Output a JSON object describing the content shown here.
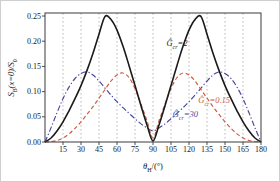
{
  "figure": {
    "bg": "#ffffff",
    "frame_color": "#3a3a3a",
    "grid_color": "#ababab"
  },
  "axes": {
    "xlabel": {
      "base": "θ",
      "sub": "H",
      "rest": "/(°)"
    },
    "ylabel": {
      "base": "S",
      "sub": "B",
      "mid": "(x=0)/S",
      "sub2": "0"
    },
    "x_ticks": [
      "15",
      "30",
      "45",
      "60",
      "75",
      "90",
      "105",
      "120",
      "135",
      "150",
      "165",
      "180"
    ],
    "y_ticks": [
      "0.00",
      "0.05",
      "0.10",
      "0.15",
      "0.20",
      "0.25"
    ]
  },
  "chart_data": {
    "type": "line",
    "title": "",
    "xlabel": "theta_H in degrees",
    "ylabel": "S_B(x=0)/S_0",
    "xlim": [
      0,
      180
    ],
    "ylim": [
      0,
      0.256
    ],
    "grid": "vertical dashed gridlines every 15 degrees, no horizontal gridlines",
    "legend_position": "inline curve annotations",
    "x": [
      0,
      5,
      10,
      15,
      20,
      25,
      30,
      35,
      40,
      45,
      50,
      55,
      60,
      65,
      70,
      75,
      80,
      85,
      90,
      95,
      100,
      105,
      110,
      115,
      120,
      125,
      130,
      135,
      140,
      145,
      150,
      155,
      160,
      165,
      170,
      175,
      180
    ],
    "series": [
      {
        "name": "Ĝcr=2",
        "color": "#1a1a1a",
        "style": "solid",
        "values": [
          0,
          0.008,
          0.022,
          0.04,
          0.062,
          0.086,
          0.112,
          0.142,
          0.176,
          0.214,
          0.249,
          0.243,
          0.222,
          0.19,
          0.152,
          0.112,
          0.072,
          0.034,
          0.002,
          0.034,
          0.072,
          0.112,
          0.152,
          0.19,
          0.222,
          0.243,
          0.249,
          0.214,
          0.176,
          0.142,
          0.112,
          0.086,
          0.062,
          0.04,
          0.022,
          0.008,
          0
        ]
      },
      {
        "name": "Ĝcr=0.15",
        "color": "#cf5a3d",
        "style": "dashed",
        "values": [
          0,
          0.001,
          0.003,
          0.008,
          0.016,
          0.027,
          0.04,
          0.055,
          0.07,
          0.087,
          0.104,
          0.121,
          0.133,
          0.137,
          0.128,
          0.106,
          0.075,
          0.042,
          0.008,
          0.042,
          0.075,
          0.106,
          0.128,
          0.137,
          0.133,
          0.121,
          0.104,
          0.087,
          0.07,
          0.055,
          0.04,
          0.027,
          0.016,
          0.008,
          0.003,
          0.001,
          0
        ]
      },
      {
        "name": "Ĝcr=30",
        "color": "#45459d",
        "style": "dashdot",
        "values": [
          0,
          0.028,
          0.058,
          0.086,
          0.109,
          0.126,
          0.136,
          0.139,
          0.133,
          0.121,
          0.107,
          0.093,
          0.08,
          0.068,
          0.057,
          0.046,
          0.036,
          0.028,
          0.022,
          0.028,
          0.036,
          0.046,
          0.057,
          0.068,
          0.08,
          0.093,
          0.107,
          0.121,
          0.133,
          0.139,
          0.136,
          0.126,
          0.109,
          0.086,
          0.058,
          0.028,
          0
        ]
      }
    ],
    "annotations": [
      {
        "base": "Ĝ",
        "sub": "cr",
        "rest": "=2",
        "theta": 110,
        "value": 0.196,
        "color": "#1a1a1a"
      },
      {
        "base": "Ĝ",
        "sub": "cr",
        "rest": "=0.15",
        "theta": 141,
        "value": 0.084,
        "color": "#cf5a3d"
      },
      {
        "base": "Ĝ",
        "sub": "cr",
        "rest": "=30",
        "theta": 117,
        "value": 0.056,
        "color": "#45459d"
      }
    ]
  }
}
